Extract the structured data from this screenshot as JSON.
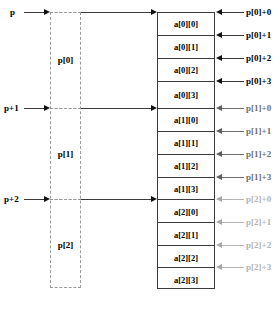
{
  "diagram": {
    "pointer_labels": [
      {
        "text": "p",
        "tone": "black"
      },
      {
        "text": "p+1",
        "tone": "black"
      },
      {
        "text": "p+2",
        "tone": "black"
      }
    ],
    "pointer_box": {
      "cells": [
        {
          "text": "p[0]",
          "tone": "black"
        },
        {
          "text": "p[1]",
          "tone": "gray"
        },
        {
          "text": "p[2]",
          "tone": "light"
        }
      ]
    },
    "array_table": {
      "cells": [
        {
          "text": "a[0][0]",
          "tone": "black"
        },
        {
          "text": "a[0][1]",
          "tone": "black"
        },
        {
          "text": "a[0][2]",
          "tone": "black"
        },
        {
          "text": "a[0][3]",
          "tone": "black"
        },
        {
          "text": "a[1][0]",
          "tone": "gray"
        },
        {
          "text": "a[1][1]",
          "tone": "gray"
        },
        {
          "text": "a[1][2]",
          "tone": "gray"
        },
        {
          "text": "a[1][3]",
          "tone": "gray"
        },
        {
          "text": "a[2][0]",
          "tone": "light"
        },
        {
          "text": "a[2][1]",
          "tone": "light"
        },
        {
          "text": "a[2][2]",
          "tone": "light"
        },
        {
          "text": "a[2][3]",
          "tone": "light"
        }
      ]
    },
    "address_labels": [
      {
        "text": "p[0]+0",
        "tone": "black"
      },
      {
        "text": "p[0]+1",
        "tone": "black"
      },
      {
        "text": "p[0]+2",
        "tone": "black"
      },
      {
        "text": "p[0]+3",
        "tone": "black"
      },
      {
        "text": "p[1]+0",
        "tone": "gray"
      },
      {
        "text": "p[1]+1",
        "tone": "gray"
      },
      {
        "text": "p[1]+2",
        "tone": "gray"
      },
      {
        "text": "p[1]+3",
        "tone": "gray"
      },
      {
        "text": "p[2]+0",
        "tone": "light"
      },
      {
        "text": "p[2]+1",
        "tone": "light"
      },
      {
        "text": "p[2]+2",
        "tone": "light"
      },
      {
        "text": "p[2]+3",
        "tone": "light"
      }
    ]
  }
}
